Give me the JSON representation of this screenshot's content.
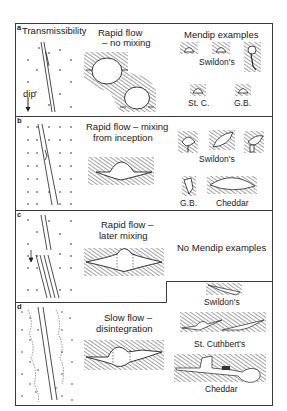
{
  "figure": {
    "panels": [
      {
        "letter": "a",
        "left_label": "Transmissibility",
        "dip_label": "dip",
        "mode_title_line1": "Rapid flow",
        "mode_title_line2": "– no mixing",
        "examples_title": "Mendip examples",
        "example_labels": [
          "Swildon's",
          "St. C.",
          "G.B."
        ]
      },
      {
        "letter": "b",
        "mode_title_line1": "Rapid flow – mixing",
        "mode_title_line2": "from inception",
        "example_labels": [
          "Swildon's",
          "G.B.",
          "Cheddar"
        ]
      },
      {
        "letter": "c",
        "mode_title_line1": "Rapid flow –",
        "mode_title_line2": "later mixing",
        "examples_title": "No Mendip examples"
      },
      {
        "letter": "d",
        "mode_title_line1": "Slow flow –",
        "mode_title_line2": "disintegration",
        "example_labels": [
          "Swildon's",
          "St. Cuthbert's",
          "Cheddar"
        ]
      }
    ],
    "colors": {
      "ink": "#1a1a1a",
      "border": "#3a3a3a",
      "background": "#ffffff"
    }
  }
}
